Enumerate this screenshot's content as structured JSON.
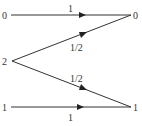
{
  "diagram": {
    "left_nodes": [
      {
        "id": "top-left",
        "label": "0"
      },
      {
        "id": "mid-left",
        "label": "2"
      },
      {
        "id": "bottom-left",
        "label": "1"
      }
    ],
    "right_nodes": [
      {
        "id": "top-right",
        "label": "0"
      },
      {
        "id": "bottom-right",
        "label": "1"
      }
    ],
    "edges": [
      {
        "from": "top-left",
        "to": "top-right",
        "weight": "1"
      },
      {
        "from": "mid-left",
        "to": "top-right",
        "weight": "1/2"
      },
      {
        "from": "mid-left",
        "to": "bottom-right",
        "weight": "1/2"
      },
      {
        "from": "bottom-left",
        "to": "bottom-right",
        "weight": "1"
      }
    ],
    "colors": {
      "line": "#333333",
      "text": "#333333"
    }
  }
}
